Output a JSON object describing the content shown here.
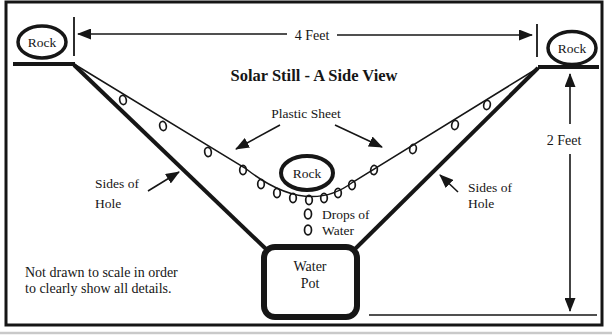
{
  "figure": {
    "title": "Solar Still - A Side View",
    "dimensions": {
      "width_label": "4 Feet",
      "depth_label": "2 Feet"
    },
    "rocks": {
      "left": "Rock",
      "right": "Rock",
      "center": "Rock"
    },
    "labels": {
      "plastic_sheet": "Plastic Sheet",
      "drops_of_water": {
        "line1": "Drops of",
        "line2": "Water"
      },
      "sides_of_hole_left": {
        "line1": "Sides of",
        "line2": "Hole"
      },
      "sides_of_hole_right": {
        "line1": "Sides of",
        "line2": "Hole"
      },
      "water_pot": {
        "line1": "Water",
        "line2": "Pot"
      },
      "note": {
        "line1": "Not drawn to scale in order",
        "line2": "to clearly show all details."
      }
    },
    "colors": {
      "ink": "#161616",
      "background": "#ffffff"
    }
  }
}
